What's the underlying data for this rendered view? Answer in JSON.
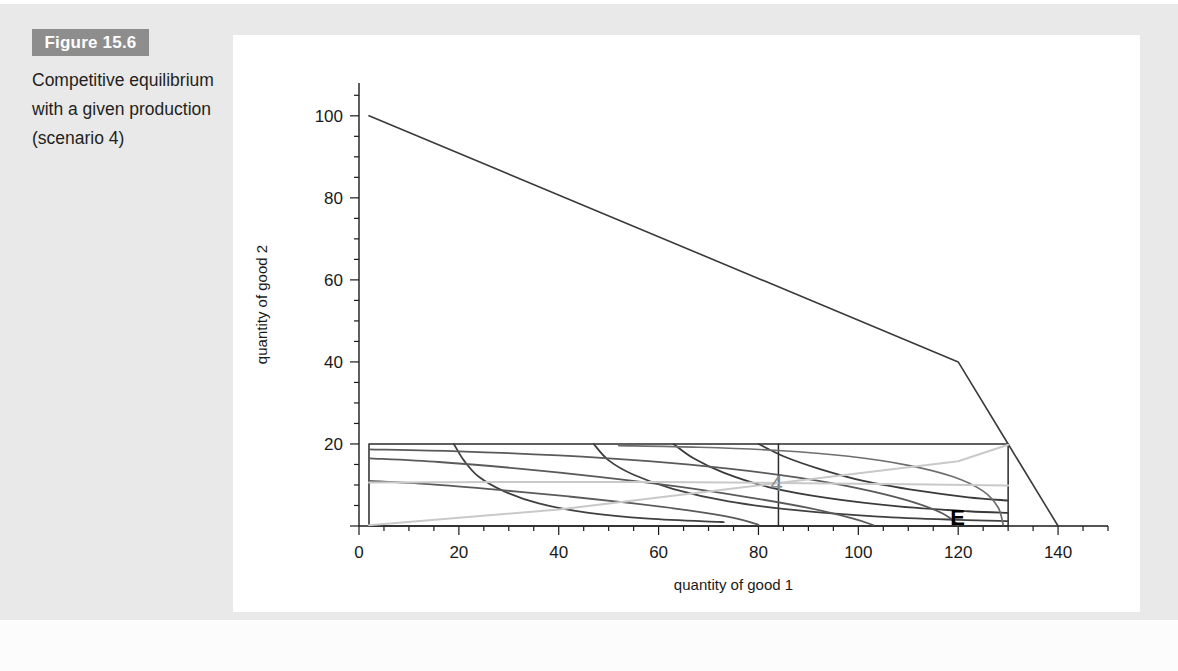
{
  "figure": {
    "badge_label": "Figure 15.6",
    "caption": "Competitive equilibrium with a given production (scenario 4)",
    "badge_bg": "#8d8d8d",
    "badge_fg": "#ffffff",
    "page_bg": "#e9e9e9",
    "panel_bg": "#ffffff"
  },
  "chart_data": {
    "type": "line",
    "title": "Competitive equilibrium with a given production (scenario 4)",
    "xlabel": "quantity of good 1",
    "ylabel": "quantity of good 2",
    "xlim": [
      0,
      150
    ],
    "ylim": [
      0,
      108
    ],
    "xticks": [
      0,
      20,
      40,
      60,
      80,
      100,
      120,
      140
    ],
    "xtick_labels": [
      "0",
      "20",
      "40",
      "60",
      "80",
      "100",
      "120",
      "140"
    ],
    "yticks": [
      0,
      20,
      40,
      60,
      80,
      100
    ],
    "ytick_labels": [
      "0",
      "20",
      "40",
      "60",
      "80",
      "100"
    ],
    "minor_tick_step_x": 5,
    "minor_tick_step_y": 5,
    "grid": false,
    "legend": "none",
    "annotations": [
      {
        "text": "4",
        "x": 84,
        "y": 10.5,
        "color": "#8c8c8c"
      },
      {
        "text": "E",
        "x": 120,
        "y": 2.2,
        "color": "#000000"
      }
    ],
    "series": [
      {
        "name": "production possibility frontier",
        "color": "#3a3a3a",
        "width": 1.6,
        "points": [
          [
            2,
            100
          ],
          [
            120,
            40
          ],
          [
            130,
            20
          ],
          [
            140,
            0
          ]
        ]
      },
      {
        "name": "edgeworth-box",
        "color": "#2b2b2b",
        "width": 1.5,
        "points": [
          [
            2,
            20
          ],
          [
            130,
            20
          ],
          [
            130,
            0
          ],
          [
            2,
            0
          ],
          [
            2,
            20
          ]
        ]
      },
      {
        "name": "allocation-vertical-line",
        "color": "#2b2b2b",
        "width": 1.5,
        "points": [
          [
            84,
            20
          ],
          [
            84,
            0
          ]
        ]
      },
      {
        "name": "consumer1-indifference-curve-a",
        "color": "#404040",
        "width": 1.8,
        "points": [
          [
            19,
            20
          ],
          [
            21,
            16
          ],
          [
            24,
            12
          ],
          [
            29,
            8.5
          ],
          [
            36,
            5.5
          ],
          [
            46,
            3.2
          ],
          [
            58,
            1.8
          ],
          [
            72,
            1.0
          ],
          [
            72,
            1.0
          ]
        ]
      },
      {
        "name": "consumer1-indifference-curve-b",
        "color": "#404040",
        "width": 1.8,
        "points": [
          [
            47,
            20
          ],
          [
            50,
            16
          ],
          [
            55,
            12.5
          ],
          [
            63,
            9
          ],
          [
            74,
            6
          ],
          [
            88,
            3.8
          ],
          [
            104,
            2.3
          ],
          [
            120,
            1.5
          ],
          [
            130,
            1.2
          ]
        ]
      },
      {
        "name": "consumer1-indifference-curve-c",
        "color": "#3a3a3a",
        "width": 1.8,
        "points": [
          [
            63,
            20
          ],
          [
            67,
            16.5
          ],
          [
            73,
            13
          ],
          [
            82,
            9.5
          ],
          [
            94,
            6.8
          ],
          [
            108,
            4.8
          ],
          [
            122,
            3.6
          ],
          [
            130,
            3.2
          ]
        ]
      },
      {
        "name": "consumer1-indifference-curve-d",
        "color": "#3a3a3a",
        "width": 1.8,
        "points": [
          [
            80,
            20
          ],
          [
            85,
            17
          ],
          [
            92,
            14
          ],
          [
            101,
            11
          ],
          [
            112,
            8.6
          ],
          [
            122,
            7.0
          ],
          [
            130,
            6.2
          ]
        ]
      },
      {
        "name": "consumer2-indifference-curve-a",
        "color": "#5a5a5a",
        "width": 1.8,
        "points": [
          [
            2,
            11.0
          ],
          [
            14,
            10.2
          ],
          [
            28,
            8.8
          ],
          [
            42,
            7.2
          ],
          [
            55,
            5.5
          ],
          [
            66,
            3.8
          ],
          [
            75,
            2.0
          ],
          [
            80,
            0.3
          ]
        ]
      },
      {
        "name": "consumer2-indifference-curve-b",
        "color": "#5a5a5a",
        "width": 1.8,
        "points": [
          [
            2,
            16.5
          ],
          [
            16,
            15.6
          ],
          [
            32,
            14.0
          ],
          [
            48,
            12.0
          ],
          [
            64,
            9.6
          ],
          [
            78,
            7.0
          ],
          [
            90,
            4.4
          ],
          [
            99,
            1.8
          ],
          [
            103,
            0.2
          ]
        ]
      },
      {
        "name": "consumer2-indifference-curve-c",
        "color": "#5a5a5a",
        "width": 1.8,
        "points": [
          [
            2,
            18.7
          ],
          [
            20,
            18.2
          ],
          [
            40,
            17.2
          ],
          [
            58,
            15.8
          ],
          [
            74,
            14.0
          ],
          [
            88,
            11.8
          ],
          [
            100,
            9.2
          ],
          [
            110,
            6.2
          ],
          [
            117,
            3.0
          ],
          [
            120,
            0.2
          ]
        ]
      },
      {
        "name": "consumer2-indifference-curve-d",
        "color": "#6e6e6e",
        "width": 1.7,
        "points": [
          [
            52,
            19.6
          ],
          [
            68,
            19.2
          ],
          [
            84,
            18.4
          ],
          [
            98,
            17.0
          ],
          [
            110,
            14.8
          ],
          [
            119,
            12.0
          ],
          [
            125,
            8.5
          ],
          [
            128,
            4.5
          ],
          [
            129,
            0.3
          ]
        ]
      },
      {
        "name": "budget-line",
        "color": "#c9c9c9",
        "width": 2.0,
        "points": [
          [
            2,
            0.2
          ],
          [
            40,
            4.0
          ],
          [
            84,
            10.5
          ],
          [
            120,
            15.8
          ],
          [
            130,
            19.8
          ]
        ]
      },
      {
        "name": "price-line-light",
        "color": "#c9c9c9",
        "width": 2.0,
        "points": [
          [
            2,
            10.6
          ],
          [
            30,
            10.7
          ],
          [
            60,
            10.7
          ],
          [
            84,
            10.5
          ],
          [
            110,
            10.2
          ],
          [
            130,
            9.9
          ]
        ]
      }
    ]
  }
}
